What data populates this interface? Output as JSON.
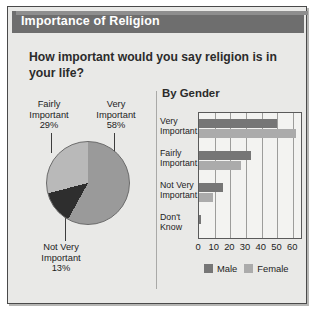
{
  "title": "Importance of Religion",
  "question": "How important would you say religion is in your life?",
  "bars_heading": "By Gender",
  "legend": {
    "male": "Male",
    "female": "Female"
  },
  "colors": {
    "titlebar": "#6e6e6e",
    "panel": "#e9e9e7",
    "male": "#767676",
    "female": "#ababab",
    "very_important_slice": "#9a9a9a",
    "fairly_important_slice": "#b9b9b9",
    "not_very_important_slice": "#2e2e2e"
  },
  "pie_labels": {
    "fairly": "Fairly\nImportant\n29%",
    "fairly_line1": "Fairly",
    "fairly_line2": "Important",
    "fairly_pct": "29%",
    "very_line1": "Very",
    "very_line2": "Important",
    "very_pct": "58%",
    "notvery_line1": "Not Very",
    "notvery_line2": "Important",
    "notvery_pct": "13%"
  },
  "bar_categories": {
    "very_l1": "Very",
    "very_l2": "Important",
    "fairly_l1": "Fairly",
    "fairly_l2": "Important",
    "notvery_l1": "Not Very",
    "notvery_l2": "Important",
    "dontknow_l1": "Don't",
    "dontknow_l2": "Know"
  },
  "chart_data": [
    {
      "type": "pie",
      "title": "Importance of Religion",
      "subtitle": "How important would you say religion is in your life?",
      "categories": [
        "Very Important",
        "Fairly Important",
        "Not Very Important"
      ],
      "values": [
        58,
        29,
        13
      ],
      "labels": [
        "58%",
        "29%",
        "13%"
      ],
      "unit": "percent",
      "colors": [
        "#9a9a9a",
        "#b9b9b9",
        "#2e2e2e"
      ],
      "legend": "labels-with-leader-lines",
      "grid": false
    },
    {
      "type": "bar",
      "orientation": "horizontal",
      "title": "By Gender",
      "categories": [
        "Very Important",
        "Fairly Important",
        "Not Very Important",
        "Don't Know"
      ],
      "series": [
        {
          "name": "Male",
          "values": [
            50,
            33,
            15,
            1
          ],
          "color": "#767676"
        },
        {
          "name": "Female",
          "values": [
            62,
            27,
            9,
            0
          ],
          "color": "#ababab"
        }
      ],
      "xlabel": "",
      "ylabel": "",
      "xlim": [
        0,
        65
      ],
      "xticks": [
        0,
        10,
        20,
        30,
        40,
        50,
        60
      ],
      "ticklabels": [
        "0",
        "10",
        "20",
        "30",
        "40",
        "50",
        "60"
      ],
      "grid": true,
      "legend_position": "bottom"
    }
  ]
}
